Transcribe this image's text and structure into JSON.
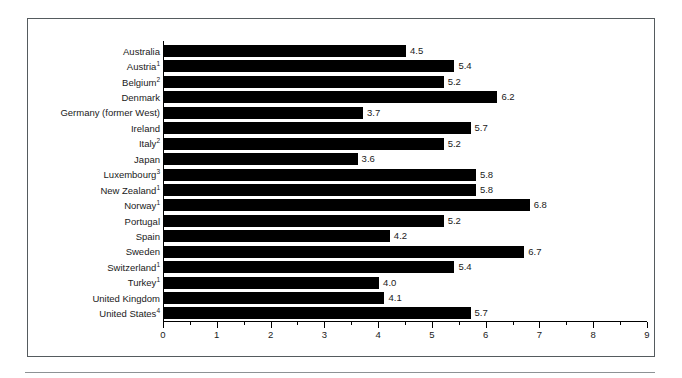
{
  "chart_data": {
    "type": "bar",
    "orientation": "horizontal",
    "title": "",
    "subtitle": "",
    "xlabel": "",
    "ylabel": "",
    "xlim": [
      0,
      9
    ],
    "grid": false,
    "legend": null,
    "bar_color": "#000000",
    "x_ticks": [
      "0",
      "1",
      "2",
      "3",
      "4",
      "5",
      "6",
      "7",
      "8",
      "9"
    ],
    "x_tick_values": [
      0,
      1,
      2,
      3,
      4,
      5,
      6,
      7,
      8,
      9
    ],
    "x_minor_step": 0.5,
    "categories": [
      "Australia",
      "Austria",
      "Belgium",
      "Denmark",
      "Germany (former West)",
      "Ireland",
      "Italy",
      "Japan",
      "Luxembourg",
      "New Zealand",
      "Norway",
      "Portugal",
      "Spain",
      "Sweden",
      "Switzerland",
      "Turkey",
      "United Kingdom",
      "United States"
    ],
    "category_footnotes": [
      "",
      "1",
      "2",
      "",
      "",
      "",
      "2",
      "",
      "3",
      "1",
      "1",
      "",
      "",
      "",
      "1",
      "1",
      "",
      "4"
    ],
    "values": [
      4.5,
      5.4,
      5.2,
      6.2,
      3.7,
      5.7,
      5.2,
      3.6,
      5.8,
      5.8,
      6.8,
      5.2,
      4.2,
      6.7,
      5.4,
      4.0,
      4.1,
      5.7
    ],
    "value_labels": [
      "4.5",
      "5.4",
      "5.2",
      "6.2",
      "3.7",
      "5.7",
      "5.2",
      "3.6",
      "5.8",
      "5.8",
      "6.8",
      "5.2",
      "4.2",
      "6.7",
      "5.4",
      "4.0",
      "4.1",
      "5.7"
    ]
  }
}
